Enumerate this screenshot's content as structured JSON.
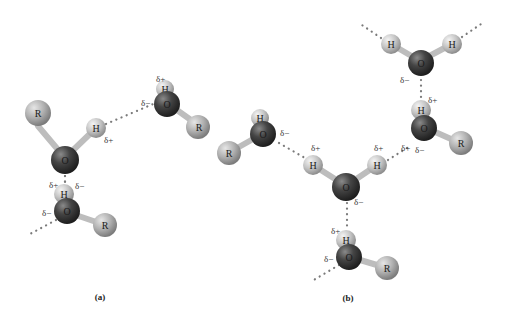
{
  "figure": {
    "colors": {
      "oxygen": "#3a3a3a",
      "hydrogen": "#c8c8c8",
      "r_group": "#b4b4b4",
      "bond": "#cfcfcf",
      "hbond_dots": "#7a7a7a"
    },
    "panels": [
      {
        "id": "a",
        "label": "(a)"
      },
      {
        "id": "b",
        "label": "(b)"
      }
    ],
    "atoms": {
      "O": "O",
      "H": "H",
      "R": "R"
    },
    "charges": {
      "plus": "δ+",
      "minus": "δ−"
    }
  }
}
